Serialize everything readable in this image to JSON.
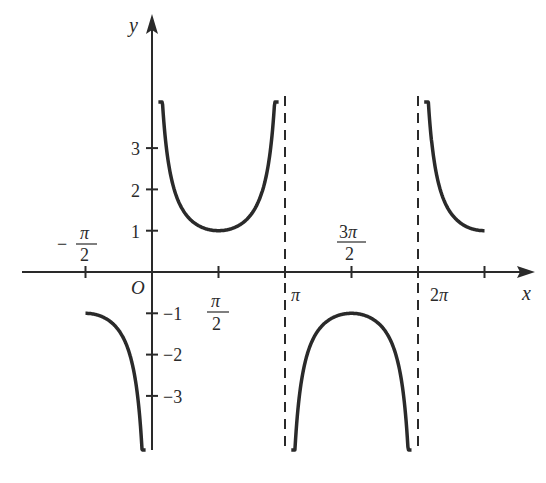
{
  "chart_data": {
    "type": "line",
    "function": "y = csc x",
    "title": "",
    "xlabel": "x",
    "ylabel": "y",
    "origin_label": "O",
    "x_ticks": [
      {
        "value": -1.5708,
        "label": "-π/2"
      },
      {
        "value": 1.5708,
        "label": "π/2"
      },
      {
        "value": 3.1416,
        "label": "π"
      },
      {
        "value": 4.7124,
        "label": "3π/2"
      },
      {
        "value": 6.2832,
        "label": "2π"
      },
      {
        "value": 7.854,
        "label": ""
      }
    ],
    "y_ticks": [
      {
        "value": 3,
        "label": "3"
      },
      {
        "value": 2,
        "label": "2"
      },
      {
        "value": 1,
        "label": "1"
      },
      {
        "value": -1,
        "label": "−1"
      },
      {
        "value": -2,
        "label": "−2"
      },
      {
        "value": -3,
        "label": "−3"
      }
    ],
    "asymptotes": [
      3.1416,
      6.2832
    ],
    "xlim": [
      -2.3,
      8.9
    ],
    "ylim": [
      -4.3,
      6.2
    ],
    "grid": false,
    "legend": null,
    "series": [
      {
        "name": "branch (−π/2, 0)",
        "x_range": [
          -1.5708,
          -0.15
        ],
        "note": "from (−π/2, −1) down to −∞"
      },
      {
        "name": "branch (0, π)",
        "x_range": [
          0.15,
          2.99
        ],
        "min_point": [
          1.5708,
          1
        ]
      },
      {
        "name": "branch (π, 2π)",
        "x_range": [
          3.29,
          6.13
        ],
        "max_point": [
          4.7124,
          -1
        ]
      },
      {
        "name": "branch (2π, 5π/2)",
        "x_range": [
          6.43,
          7.854
        ],
        "note": "from +∞ down to (5π/2, 1)"
      }
    ],
    "colors": {
      "curve": "#2a2a2a",
      "axis": "#2a2a2a",
      "asymptote": "#2a2a2a"
    }
  }
}
